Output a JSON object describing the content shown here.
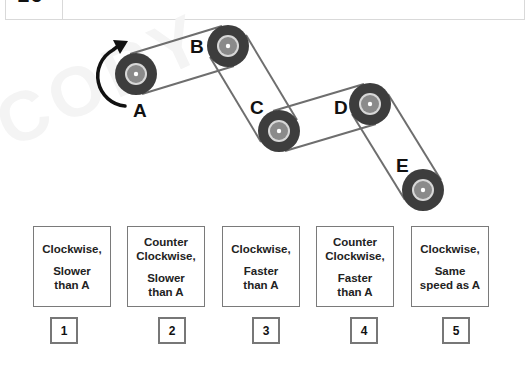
{
  "question": {
    "number": "16"
  },
  "watermark": "COPY",
  "diagram": {
    "rotation_arrow": "clockwise-arrow",
    "gears": [
      {
        "label": "A",
        "cx": 136,
        "cy": 74
      },
      {
        "label": "B",
        "cx": 228,
        "cy": 46
      },
      {
        "label": "C",
        "cx": 279,
        "cy": 131
      },
      {
        "label": "D",
        "cx": 370,
        "cy": 104
      },
      {
        "label": "E",
        "cx": 423,
        "cy": 190
      }
    ],
    "colors": {
      "gear_body": "#3d3d3d",
      "belt": "#707070",
      "hub": "#888888",
      "ring": "#d8d8d8"
    }
  },
  "options": [
    {
      "number": "1",
      "direction": "Clockwise,",
      "speed": "Slower than A"
    },
    {
      "number": "2",
      "direction": "Counter Clockwise,",
      "speed": "Slower than A"
    },
    {
      "number": "3",
      "direction": "Clockwise,",
      "speed": "Faster than A"
    },
    {
      "number": "4",
      "direction": "Counter Clockwise,",
      "speed": "Faster than A"
    },
    {
      "number": "5",
      "direction": "Clockwise,",
      "speed": "Same speed as A"
    }
  ]
}
